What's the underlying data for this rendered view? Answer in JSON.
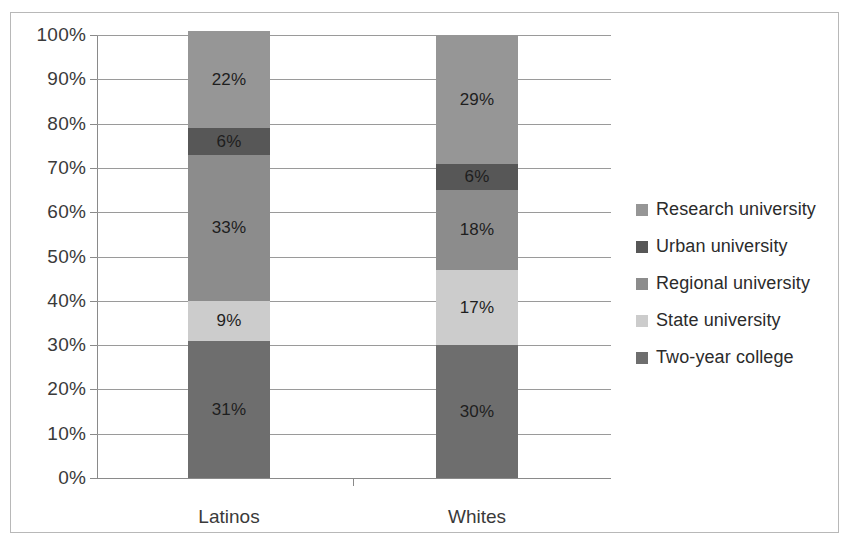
{
  "chart_data": {
    "type": "bar",
    "subtype": "stacked-100-percent",
    "title": "",
    "xlabel": "",
    "ylabel": "",
    "categories": [
      "Latinos",
      "Whites"
    ],
    "ylim": [
      0,
      100
    ],
    "ytick_labels": [
      "100%",
      "90%",
      "80%",
      "70%",
      "60%",
      "50%",
      "40%",
      "30%",
      "20%",
      "10%",
      "0%"
    ],
    "ytick_values": [
      100,
      90,
      80,
      70,
      60,
      50,
      40,
      30,
      20,
      10,
      0
    ],
    "grid": true,
    "legend_position": "right",
    "series": [
      {
        "name": "Research university",
        "color": "#969696",
        "values": [
          22,
          29
        ],
        "labels": [
          "22%",
          "29%"
        ]
      },
      {
        "name": "Urban university",
        "color": "#575757",
        "values": [
          6,
          6
        ],
        "labels": [
          "6%",
          "6%"
        ]
      },
      {
        "name": "Regional university",
        "color": "#8c8c8c",
        "values": [
          33,
          18
        ],
        "labels": [
          "33%",
          "18%"
        ]
      },
      {
        "name": "State university",
        "color": "#cccccc",
        "values": [
          9,
          17
        ],
        "labels": [
          "9%",
          "17%"
        ]
      },
      {
        "name": "Two-year college",
        "color": "#6e6e6e",
        "values": [
          31,
          30
        ],
        "labels": [
          "31%",
          "30%"
        ]
      }
    ],
    "stack_order_bottom_to_top": [
      "Two-year college",
      "State university",
      "Regional university",
      "Urban university",
      "Research university"
    ]
  },
  "legend": {
    "items": [
      {
        "label": "Research university",
        "color": "#969696"
      },
      {
        "label": "Urban university",
        "color": "#575757"
      },
      {
        "label": "Regional university",
        "color": "#8c8c8c"
      },
      {
        "label": "State university",
        "color": "#cccccc"
      },
      {
        "label": "Two-year college",
        "color": "#6e6e6e"
      }
    ]
  },
  "colors": {
    "frame_border": "#b8b8b8",
    "gridline": "#9a9a9a",
    "axis": "#8a8a8a",
    "text": "#2b2b2b",
    "background": "#ffffff"
  }
}
